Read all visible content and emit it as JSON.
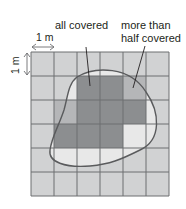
{
  "labels": {
    "all_covered": "all covered",
    "more_than_half_line1": "more than",
    "more_than_half_line2": "half covered",
    "unit_horizontal": "1 m",
    "unit_vertical": "1 m"
  },
  "grid": {
    "columns": 6,
    "rows": 6,
    "full_cells": [
      [
        2,
        1
      ],
      [
        3,
        1
      ],
      [
        2,
        2
      ],
      [
        3,
        2
      ],
      [
        4,
        2
      ],
      [
        1,
        3
      ],
      [
        2,
        3
      ],
      [
        3,
        3
      ]
    ],
    "partial_cells": [
      [
        4,
        1
      ],
      [
        1,
        2
      ]
    ]
  },
  "colors": {
    "empty_cell": "#d1d2d3",
    "partial_cell": "#b5b6b8",
    "full_cell": "#8c8e90",
    "shape_fill": "#e8e8e8",
    "grid_line": "#6d6e70",
    "outline": "#5a5b5d"
  }
}
